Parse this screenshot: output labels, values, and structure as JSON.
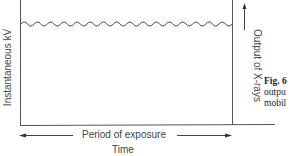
{
  "diagram": {
    "y_axis_label": "Instantaneous kV",
    "right_axis_label": "Output of X-rays",
    "period_label": "Period of exposure",
    "x_axis_label": "Time",
    "waveform": "ripple (near-constant kV with small oscillation)",
    "caption": {
      "fig_label": "Fig. 6",
      "line1": "outpu",
      "line2": "mobil"
    }
  }
}
